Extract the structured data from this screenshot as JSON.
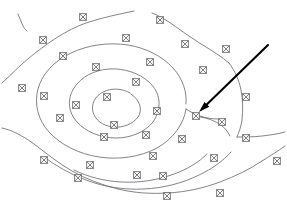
{
  "figure": {
    "type": "contour-map",
    "width": 287,
    "height": 212,
    "background_color": "#ffffff",
    "contour_color": "#6e6e72",
    "marker_color": "#5d5d62",
    "arrow_color": "#000000",
    "marker_glyph": "crossed-square",
    "faint_label_text": "",
    "faint_label_x": 124,
    "faint_label_y": 11
  },
  "contours": [
    {
      "id": "contour-outermost-top",
      "label": "outermost top-left arc",
      "path": "M 2 83 C 12 74 22 63 34 54 C 48 43 66 30 86 23 C 104 17 120 14 134 11"
    },
    {
      "id": "contour-outer-fragment-upper-left",
      "label": "upper-left short fragment",
      "path": "M 18 14 C 20 18 21 22 23 26 C 24 28 25 29 27 31"
    },
    {
      "id": "contour-outer-right-top",
      "label": "top-right descending arc",
      "path": "M 152 13 C 160 16 168 21 176 27 C 186 34 196 41 206 47 C 214 52 222 57 229 63"
    },
    {
      "id": "contour-outer-right-edge",
      "label": "right edge vertical arc",
      "path": "M 229 63 C 235 71 239 80 241 90 C 243 100 243 110 242 120 C 241 127 239 132 237 137"
    },
    {
      "id": "contour-outer-right-tail",
      "label": "right tail toward edge",
      "path": "M 237 137 C 245 137 254 137 262 136 C 270 135 278 134 285 132"
    },
    {
      "id": "contour-ring-2-main",
      "label": "second ring closed contour",
      "path": "M 186 104 C 187 92 183 79 173 68 C 162 56 146 48 128 45 C 108 42 88 45 71 53 C 54 61 42 74 38 89 C 34 104 38 120 49 132 C 61 145 79 154 99 157 C 119 160 140 157 157 148 C 173 139 184 124 186 109"
    },
    {
      "id": "contour-ring-2-tail",
      "label": "second ring open tail to right",
      "path": "M 186 109 C 190 112 195 114 200 116 C 206 118 212 119 218 119"
    },
    {
      "id": "contour-ring-3-main",
      "label": "third inner ring contour",
      "path": "M 158 111 C 161 101 158 90 149 82 C 139 73 124 68 109 69 C 94 70 81 77 74 88 C 67 99 68 112 77 122 C 86 132 101 138 116 138 C 131 138 145 132 153 122 C 156 118 157 114 158 111"
    },
    {
      "id": "contour-ring-4-innermost",
      "label": "innermost ring contour",
      "path": "M 130 93 C 122 88 111 88 103 92 C 95 96 91 104 93 112 C 95 120 103 126 113 127 C 123 128 133 124 138 117 C 143 110 140 100 131 94"
    },
    {
      "id": "contour-lower-left-1",
      "label": "lower-left sweeping arc",
      "path": "M 2 128 C 12 130 23 136 34 144 C 46 153 58 163 72 171 C 86 179 102 185 118 189"
    },
    {
      "id": "contour-lower-left-2",
      "label": "lower-left secondary arc",
      "path": "M 118 189 C 134 193 151 194 168 193 C 186 192 204 188 220 182 C 236 176 250 169 262 161"
    },
    {
      "id": "contour-lower-right-tail",
      "label": "lower-right tail to edge",
      "path": "M 262 161 C 270 156 278 151 285 146"
    },
    {
      "id": "contour-lower-mid-arc",
      "label": "lower mid arc between rings",
      "path": "M 44 157 C 56 166 70 174 86 180 C 104 187 124 190 144 189 C 164 188 183 183 199 175 C 212 169 223 161 231 152"
    },
    {
      "id": "contour-lower-inner-arc",
      "label": "lower inner arc",
      "path": "M 74 170 C 88 177 104 181 121 182 C 140 183 158 180 174 174 C 188 169 199 162 207 154"
    },
    {
      "id": "contour-right-mid-connector",
      "label": "right middle connector",
      "path": "M 200 117 C 208 118 215 121 221 125 C 225 128 228 132 230 136"
    }
  ],
  "markers": [
    {
      "id": "m01",
      "x": 83,
      "y": 17
    },
    {
      "id": "m02",
      "x": 43,
      "y": 40
    },
    {
      "id": "m03",
      "x": 63,
      "y": 56
    },
    {
      "id": "m04",
      "x": 22,
      "y": 88
    },
    {
      "id": "m05",
      "x": 44,
      "y": 96
    },
    {
      "id": "m06",
      "x": 126,
      "y": 38
    },
    {
      "id": "m07",
      "x": 96,
      "y": 67
    },
    {
      "id": "m08",
      "x": 150,
      "y": 62
    },
    {
      "id": "m09",
      "x": 136,
      "y": 82
    },
    {
      "id": "m10",
      "x": 107,
      "y": 97
    },
    {
      "id": "m11",
      "x": 76,
      "y": 105
    },
    {
      "id": "m12",
      "x": 157,
      "y": 111
    },
    {
      "id": "m13",
      "x": 114,
      "y": 125
    },
    {
      "id": "m14",
      "x": 146,
      "y": 135
    },
    {
      "id": "m15",
      "x": 104,
      "y": 137
    },
    {
      "id": "m16",
      "x": 60,
      "y": 118
    },
    {
      "id": "m17",
      "x": 185,
      "y": 44
    },
    {
      "id": "m18",
      "x": 160,
      "y": 20
    },
    {
      "id": "m19",
      "x": 226,
      "y": 49
    },
    {
      "id": "m20",
      "x": 203,
      "y": 70
    },
    {
      "id": "m21",
      "x": 246,
      "y": 97
    },
    {
      "id": "m22",
      "x": 196,
      "y": 116
    },
    {
      "id": "m23",
      "x": 222,
      "y": 122
    },
    {
      "id": "m24",
      "x": 246,
      "y": 138
    },
    {
      "id": "m25",
      "x": 182,
      "y": 139
    },
    {
      "id": "m26",
      "x": 214,
      "y": 158
    },
    {
      "id": "m27",
      "x": 153,
      "y": 156
    },
    {
      "id": "m28",
      "x": 90,
      "y": 165
    },
    {
      "id": "m29",
      "x": 44,
      "y": 160
    },
    {
      "id": "m30",
      "x": 78,
      "y": 178
    },
    {
      "id": "m31",
      "x": 137,
      "y": 175
    },
    {
      "id": "m32",
      "x": 167,
      "y": 196
    },
    {
      "id": "m33",
      "x": 220,
      "y": 193
    },
    {
      "id": "m34",
      "x": 163,
      "y": 176
    },
    {
      "id": "m35",
      "x": 277,
      "y": 161
    }
  ],
  "annotation_arrow": {
    "id": "annotation-arrow",
    "label": "annotation arrow pointing to station marker",
    "start_x": 268,
    "start_y": 45,
    "end_x": 199,
    "end_y": 112,
    "target_marker": "m22"
  }
}
